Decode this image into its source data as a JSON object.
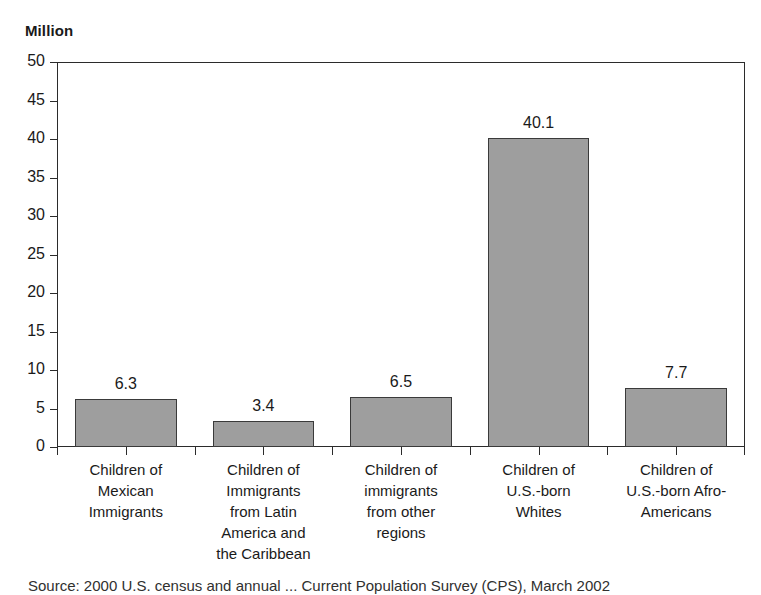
{
  "chart_data": {
    "type": "bar",
    "title": "",
    "ylabel": "Million",
    "xlabel": "",
    "ylim": [
      0,
      50
    ],
    "ytick_step": 5,
    "yticks": [
      "50",
      "45",
      "40",
      "35",
      "30",
      "25",
      "20",
      "15",
      "10",
      "5",
      "0"
    ],
    "grid": false,
    "legend": "none",
    "bar_fill_color": "#9e9e9e",
    "bar_border_color": "#3a3a3a",
    "categories": [
      "Children of Mexican Immigrants",
      "Children of Immigrants from Latin America and the Caribbean",
      "Children of immigrants from other regions",
      "Children of U.S.-born Whites",
      "Children of U.S.-born Afro-Americans"
    ],
    "category_lines": [
      [
        "Children of",
        "Mexican",
        "Immigrants"
      ],
      [
        "Children of",
        "Immigrants",
        "from Latin",
        "America and",
        "the Caribbean"
      ],
      [
        "Children of",
        "immigrants",
        "from other",
        "regions"
      ],
      [
        "Children of",
        "U.S.-born",
        "Whites"
      ],
      [
        "Children of",
        "U.S.-born Afro-",
        "Americans"
      ]
    ],
    "values": [
      6.3,
      3.4,
      6.5,
      40.1,
      7.7
    ],
    "value_labels": [
      "6.3",
      "3.4",
      "6.5",
      "40.1",
      "7.7"
    ]
  },
  "source_note": "Source: 2000 U.S. census and annual ... Current Population Survey (CPS), March 2002"
}
